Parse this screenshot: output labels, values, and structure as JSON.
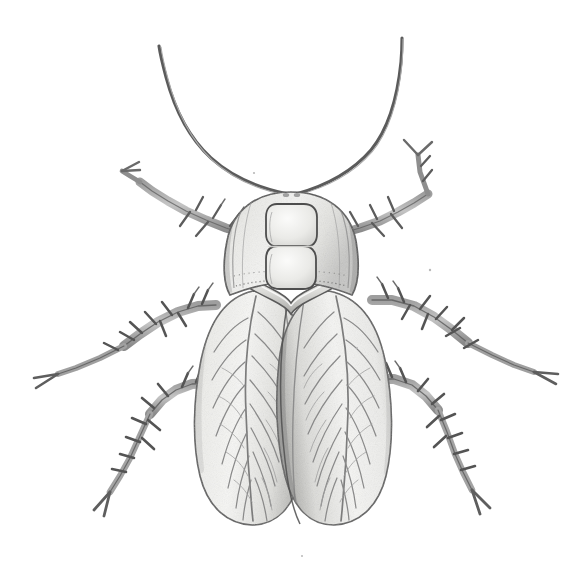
{
  "image": {
    "kind": "scientific-illustration",
    "subject": "cockroach",
    "view": "dorsal",
    "medium": "pencil / stipple line drawing",
    "width": 582,
    "height": 567,
    "background_color": "#ffffff",
    "has_text_labels": false,
    "has_border": false,
    "caption": "Dorsal view line illustration of a cockroach with long antennae, figure-eight head marking, spined legs and veined tegmina."
  },
  "palette": {
    "background": "#ffffff",
    "outline_dark": "#4a4a4a",
    "outline_mid": "#6e6e6e",
    "outline_light": "#9a9a9a",
    "body_fill_light": "#f2f2f0",
    "body_fill_mid": "#dedede",
    "body_fill_shadow": "#c3c3c3",
    "wing_fill": "#ededea",
    "wing_vein": "#8d8d8d",
    "leg_fill": "#b9b9b9",
    "leg_fill_dark": "#8c8c8c",
    "stipple": "#717171"
  },
  "anatomy": {
    "parts": [
      {
        "id": "antenna-left",
        "label": "Left antenna",
        "count": 1,
        "description": "Long filiform antenna sweeping up and to the left, tip near top-left of frame"
      },
      {
        "id": "antenna-right",
        "label": "Right antenna",
        "count": 1,
        "description": "Long filiform antenna sweeping up and to the right, tip near top-right of frame"
      },
      {
        "id": "head",
        "label": "Head capsule",
        "count": 1,
        "description": "Rounded dome with a pale figure-eight marking of two stacked rounded rectangles"
      },
      {
        "id": "head-marking",
        "label": "Figure-eight head marking",
        "count": 1,
        "description": "Two stacked pale rounded-rectangular spots on the vertex"
      },
      {
        "id": "pronotal-collar",
        "label": "Pronotal collar band",
        "count": 1,
        "description": "Raised V-shaped band separating head from thorax"
      },
      {
        "id": "tegmen-left",
        "label": "Left tegmen (forewing)",
        "count": 1,
        "description": "Elongated oval forewing with branching vein pattern"
      },
      {
        "id": "tegmen-right",
        "label": "Right tegmen (forewing)",
        "count": 1,
        "description": "Elongated oval forewing overlapping the left along the midline"
      },
      {
        "id": "leg-fore-left",
        "label": "Left foreleg",
        "count": 1,
        "description": "Spined leg directed up and left from the thorax"
      },
      {
        "id": "leg-fore-right",
        "label": "Right foreleg",
        "count": 1,
        "description": "Spined leg directed up and right from the thorax"
      },
      {
        "id": "leg-mid-left",
        "label": "Left midleg",
        "count": 1,
        "description": "Spined leg directed out and down-left, ending in a forked tarsal claw"
      },
      {
        "id": "leg-mid-right",
        "label": "Right midleg",
        "count": 1,
        "description": "Spined leg directed out and down-right, ending in a forked tarsal claw"
      },
      {
        "id": "leg-hind-left",
        "label": "Left hindleg",
        "count": 1,
        "description": "Long spined leg directed down and left, ending in a forked tarsal claw"
      },
      {
        "id": "leg-hind-right",
        "label": "Right hindleg",
        "count": 1,
        "description": "Long spined leg directed down and right, ending in a forked tarsal claw"
      },
      {
        "id": "spines",
        "label": "Tibial spines",
        "count": 6,
        "description": "Rows of sharp backward-pointing spines along femora and tibiae"
      }
    ],
    "leg_total": 6,
    "antenna_total": 2,
    "wing_total": 2
  }
}
